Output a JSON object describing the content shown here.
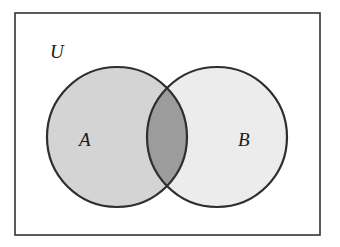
{
  "diagram": {
    "type": "venn",
    "universe": {
      "label": "U",
      "x": 15,
      "y": 13,
      "width": 305,
      "height": 222,
      "fill": "#ffffff",
      "stroke": "#333333"
    },
    "sets": [
      {
        "label": "A",
        "cx": 117,
        "cy": 137,
        "r": 70,
        "fill": "#d4d4d4",
        "stroke": "#2e2e2e",
        "label_x": 79,
        "label_y": 146
      },
      {
        "label": "B",
        "cx": 217,
        "cy": 137,
        "r": 70,
        "fill": "#ececec",
        "stroke": "#2e2e2e",
        "label_x": 238,
        "label_y": 146
      }
    ],
    "intersection": {
      "label": "A ∩ B",
      "fill": "#9c9c9c",
      "shaded": true
    },
    "universe_label_pos": {
      "x": 50,
      "y": 58
    }
  }
}
